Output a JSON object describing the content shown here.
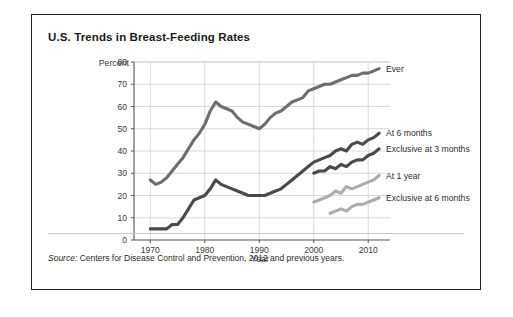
{
  "chart_title": "U.S. Trends in Breast-Feeding Rates",
  "source": {
    "label": "Source:",
    "text": " Centers for Disease Control and Prevention, 2012 and previous years."
  },
  "colors": {
    "ever": "#6e6e6e",
    "at_6_months": "#4a4a4a",
    "exclusive_at_3_months": "#4a4a4a",
    "at_1_year": "#adadad",
    "exclusive_at_6_months": "#adadad",
    "gridline": "#cfcfcf",
    "axis": "#555555",
    "border": "#222222"
  },
  "chart_data": {
    "type": "line",
    "title": "U.S. Trends in Breast-Feeding Rates",
    "xlabel": "Year",
    "ylabel": "Percent",
    "xlim": [
      1967,
      2014
    ],
    "ylim": [
      0,
      80
    ],
    "xticks": [
      1970,
      1980,
      1990,
      2000,
      2010
    ],
    "yticks": [
      0,
      10,
      20,
      30,
      40,
      50,
      60,
      70,
      80
    ],
    "grid": true,
    "legend_position": "right-inline-labels",
    "series": [
      {
        "name": "Ever",
        "color": "#6e6e6e",
        "x": [
          1970,
          1971,
          1972,
          1973,
          1974,
          1975,
          1976,
          1977,
          1978,
          1979,
          1980,
          1981,
          1982,
          1983,
          1984,
          1985,
          1986,
          1987,
          1988,
          1989,
          1990,
          1991,
          1992,
          1993,
          1994,
          1995,
          1996,
          1997,
          1998,
          1999,
          2000,
          2001,
          2002,
          2003,
          2004,
          2005,
          2006,
          2007,
          2008,
          2009,
          2010,
          2011,
          2012
        ],
        "values": [
          27,
          25,
          26,
          28,
          31,
          34,
          37,
          41,
          45,
          48,
          52,
          58,
          62,
          60,
          59,
          58,
          55,
          53,
          52,
          51,
          50,
          52,
          55,
          57,
          58,
          60,
          62,
          63,
          64,
          67,
          68,
          69,
          70,
          70,
          71,
          72,
          73,
          74,
          74,
          75,
          75,
          76,
          77
        ]
      },
      {
        "name": "At 6 months",
        "color": "#4a4a4a",
        "x": [
          1970,
          1971,
          1972,
          1973,
          1974,
          1975,
          1976,
          1977,
          1978,
          1979,
          1980,
          1981,
          1982,
          1983,
          1984,
          1985,
          1986,
          1987,
          1988,
          1989,
          1990,
          1991,
          1992,
          1993,
          1994,
          1995,
          1996,
          1997,
          1998,
          1999,
          2000,
          2001,
          2002,
          2003,
          2004,
          2005,
          2006,
          2007,
          2008,
          2009,
          2010,
          2011,
          2012
        ],
        "values": [
          5,
          5,
          5,
          5,
          7,
          7,
          10,
          14,
          18,
          19,
          20,
          23,
          27,
          25,
          24,
          23,
          22,
          21,
          20,
          20,
          20,
          20,
          21,
          22,
          23,
          25,
          27,
          29,
          31,
          33,
          35,
          36,
          37,
          38,
          40,
          41,
          40,
          43,
          44,
          43,
          45,
          46,
          48
        ]
      },
      {
        "name": "Exclusive at 3 months",
        "color": "#4a4a4a",
        "x": [
          2000,
          2001,
          2002,
          2003,
          2004,
          2005,
          2006,
          2007,
          2008,
          2009,
          2010,
          2011,
          2012
        ],
        "values": [
          30,
          31,
          31,
          33,
          32,
          34,
          33,
          35,
          36,
          36,
          38,
          39,
          41
        ]
      },
      {
        "name": "At 1 year",
        "color": "#adadad",
        "x": [
          1999,
          2000,
          2001,
          2002,
          2003,
          2004,
          2005,
          2006,
          2007,
          2008,
          2009,
          2010,
          2011,
          2012
        ],
        "values": [
          16,
          17,
          18,
          19,
          20,
          22,
          21,
          24,
          23,
          24,
          25,
          26,
          27,
          29
        ]
      },
      {
        "name": "Exclusive at 6 months",
        "color": "#adadad",
        "x": [
          2003,
          2004,
          2005,
          2006,
          2007,
          2008,
          2009,
          2010,
          2011,
          2012
        ],
        "values": [
          12,
          13,
          14,
          13,
          15,
          16,
          16,
          17,
          18,
          19
        ]
      }
    ],
    "segment_gaps": {
      "At 1 year": [
        [
          1999,
          2000
        ]
      ]
    }
  }
}
